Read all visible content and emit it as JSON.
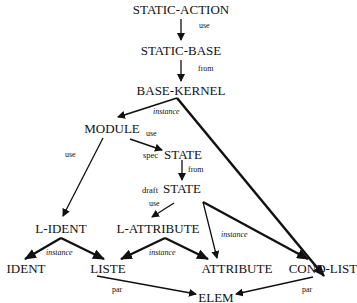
{
  "nodes": {
    "static_action": "STATIC-ACTION",
    "static_base": "STATIC-BASE",
    "base_kernel": "BASE-KERNEL",
    "module": "MODULE",
    "spec_state": "STATE",
    "draft_state": "STATE",
    "l_ident": "L-IDENT",
    "l_attribute": "L-ATTRIBUTE",
    "ident": "IDENT",
    "liste": "LISTE",
    "attribute": "ATTRIBUTE",
    "cond_list": "COND-LIST",
    "elem": "ELEM"
  },
  "prefixes": {
    "spec": "spec",
    "draft": "draft"
  },
  "edge_labels": {
    "static_action_to_static_base": "use",
    "static_base_to_base_kernel": "from",
    "base_kernel_to_module": "instance",
    "module_to_spec_state": "use",
    "spec_state_to_draft_state": "from",
    "module_to_l_ident": "use",
    "draft_state_to_l_attribute": "use",
    "l_ident_to_ident_liste": "instance",
    "l_attribute_to_liste_attribute": "instance",
    "draft_state_to_attribute_cond_list": "instance",
    "liste_to_elem": "par",
    "cond_list_to_elem": "par"
  }
}
